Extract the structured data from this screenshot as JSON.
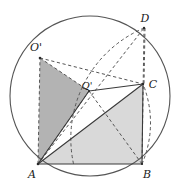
{
  "figure": {
    "name": "square-rotation-circle-diagram",
    "canvas": {
      "width": 181,
      "height": 193,
      "background": "#ffffff"
    },
    "colors": {
      "stroke": "#4a4a4a",
      "stroke_dark": "#3a3a3a",
      "dashed": "#555555",
      "fill_dark": "#b3b3b3",
      "fill_light": "#d9d9d9",
      "label": "#1a1a1a",
      "circle": "#555555"
    },
    "circle": {
      "label": "circumscribed-circle",
      "cx": 90,
      "cy": 96,
      "r": 80
    },
    "points": [
      {
        "id": "A",
        "label": "A",
        "x": 38,
        "y": 164,
        "label_x": 32,
        "label_y": 177
      },
      {
        "id": "B",
        "label": "B",
        "x": 142,
        "y": 164,
        "label_x": 145,
        "label_y": 177
      },
      {
        "id": "C",
        "label": "C",
        "x": 143,
        "y": 84,
        "label_x": 150,
        "label_y": 86
      },
      {
        "id": "D",
        "label": "D",
        "x": 144,
        "y": 28,
        "label_x": 143,
        "label_y": 22
      },
      {
        "id": "Oprime_top",
        "label": "O'",
        "x": 40,
        "y": 58,
        "label_x": 33,
        "label_y": 51
      },
      {
        "id": "Qprime_center",
        "label": "Q'",
        "x": 89,
        "y": 91,
        "label_x": 85,
        "label_y": 89
      }
    ],
    "solid_segments": [
      {
        "name": "segment-A-to-C",
        "from": "A",
        "to": "C"
      },
      {
        "name": "segment-A-to-B",
        "from": "A",
        "to": "B"
      },
      {
        "name": "segment-A-to-Qprime",
        "from": "A",
        "to": "Qprime_center"
      },
      {
        "name": "segment-Qprime-to-C",
        "from": "Qprime_center",
        "to": "C"
      },
      {
        "name": "segment-B-to-C",
        "from": "B",
        "to": "C"
      }
    ],
    "dashed_segments": [
      {
        "name": "segment-A-to-Oprime",
        "from": "A",
        "to": "Oprime_top"
      },
      {
        "name": "segment-A-to-Oprime-diagonal",
        "from": "A",
        "to": "Oprime_top"
      },
      {
        "name": "segment-Oprime-to-Qprime",
        "from": "Oprime_top",
        "to": "Qprime_center"
      },
      {
        "name": "segment-Oprime-to-C",
        "from": "Oprime_top",
        "to": "C"
      },
      {
        "name": "segment-A-to-D",
        "from": "A",
        "to": "D"
      },
      {
        "name": "segment-D-to-C",
        "from": "D",
        "to": "C"
      },
      {
        "name": "segment-D-to-B",
        "from": "D",
        "to": "B"
      },
      {
        "name": "segment-Qprime-to-B",
        "from": "Qprime_center",
        "to": "B"
      },
      {
        "name": "segment-Oprime-to-Asquare",
        "from": "Oprime_top",
        "to": "A"
      }
    ],
    "dashed_arcs": [
      {
        "name": "arc-A-to-C-radius-AB",
        "center": "A",
        "from_x": 142,
        "from_y": 164,
        "to_x": 143,
        "to_y": 84,
        "r": 104
      },
      {
        "name": "arc-D-to-C-radius",
        "center": "C",
        "from_x": 144,
        "from_y": 28,
        "to_x": 96,
        "to_y": 140,
        "r": 56
      }
    ],
    "shaded_regions": [
      {
        "name": "dark-triangle-A-Oprime-Qprime",
        "fill": "#b3b3b3",
        "vertices": [
          "A",
          "Oprime_top",
          "Qprime_center"
        ]
      },
      {
        "name": "light-triangle-A-B-C",
        "fill": "#d9d9d9",
        "vertices": [
          "A",
          "B",
          "C"
        ]
      }
    ],
    "labels": {
      "A": "A",
      "B": "B",
      "C": "C",
      "D": "D",
      "Oprime_top": "O'",
      "Qprime_center": "Q'"
    }
  }
}
